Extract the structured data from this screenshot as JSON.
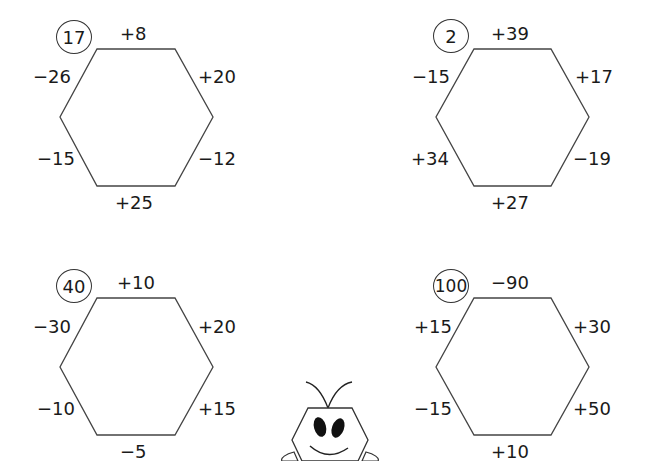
{
  "puzzles": [
    {
      "start": "17",
      "edges": {
        "top": "+8",
        "upper_right": "+20",
        "lower_right": "−12",
        "bottom": "+25",
        "lower_left": "−15",
        "upper_left": "−26"
      }
    },
    {
      "start": "2",
      "edges": {
        "top": "+39",
        "upper_right": "+17",
        "lower_right": "−19",
        "bottom": "+27",
        "lower_left": "+34",
        "upper_left": "−15"
      }
    },
    {
      "start": "40",
      "edges": {
        "top": "+10",
        "upper_right": "+20",
        "lower_right": "+15",
        "bottom": "−5",
        "lower_left": "−10",
        "upper_left": "−30"
      }
    },
    {
      "start": "100",
      "edges": {
        "top": "−90",
        "upper_right": "+30",
        "lower_right": "+50",
        "bottom": "+10",
        "lower_left": "−15",
        "upper_left": "+15"
      }
    }
  ],
  "icons": {
    "mascot": "hexagon-bug-mascot-icon"
  }
}
